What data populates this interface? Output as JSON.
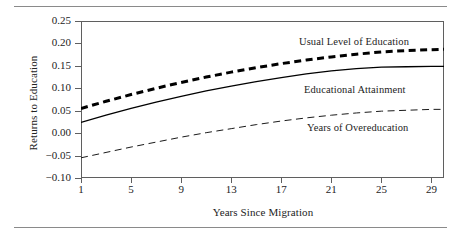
{
  "chart_data": {
    "type": "line",
    "title": "",
    "xlabel": "Years Since Migration",
    "ylabel": "Returns to Education",
    "xlim": [
      1,
      30
    ],
    "ylim": [
      -0.1,
      0.25
    ],
    "grid": false,
    "legend_position": "inline-right",
    "xticks": [
      "1",
      "5",
      "9",
      "13",
      "17",
      "21",
      "25",
      "29"
    ],
    "xtick_values": [
      1,
      5,
      9,
      13,
      17,
      21,
      25,
      29
    ],
    "yticks": [
      "0.25",
      "0.20",
      "0.15",
      "0.10",
      "0.05",
      "0.00",
      "−0.05",
      "−0.10"
    ],
    "ytick_values": [
      0.25,
      0.2,
      0.15,
      0.1,
      0.05,
      0.0,
      -0.05,
      -0.1
    ],
    "x": [
      1,
      3,
      5,
      7,
      9,
      11,
      13,
      15,
      17,
      19,
      21,
      23,
      25,
      27,
      29,
      30
    ],
    "series": [
      {
        "name": "Usual Level of Education",
        "style": "thick-dashed",
        "color": "#000000",
        "values": [
          0.055,
          0.071,
          0.086,
          0.1,
          0.113,
          0.125,
          0.136,
          0.146,
          0.155,
          0.163,
          0.17,
          0.176,
          0.181,
          0.184,
          0.186,
          0.187
        ]
      },
      {
        "name": "Educational Attainment",
        "style": "solid",
        "color": "#000000",
        "values": [
          0.024,
          0.04,
          0.055,
          0.069,
          0.082,
          0.094,
          0.105,
          0.115,
          0.124,
          0.132,
          0.139,
          0.144,
          0.147,
          0.148,
          0.149,
          0.149
        ]
      },
      {
        "name": "Years of Overeducation",
        "style": "thin-dashed",
        "color": "#1a1a1a",
        "values": [
          -0.055,
          -0.043,
          -0.031,
          -0.02,
          -0.009,
          0.001,
          0.01,
          0.019,
          0.027,
          0.034,
          0.04,
          0.045,
          0.049,
          0.051,
          0.053,
          0.053
        ]
      }
    ]
  },
  "annotations": {
    "usual_level_label": "Usual Level of Education",
    "educational_attainment_label": "Educational Attainment",
    "years_overeducation_label": "Years of Overeducation"
  },
  "axis": {
    "y_title": "Returns to Education",
    "x_title": "Years Since Migration"
  },
  "colors": {
    "axis": "#5f5f5f",
    "rule": "#8a8a8a",
    "text": "#232323",
    "line": "#000000"
  }
}
